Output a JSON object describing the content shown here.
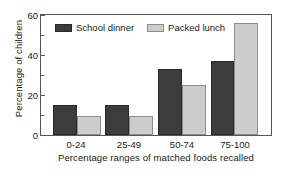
{
  "chart_data": {
    "type": "bar",
    "title": "",
    "subtitle": "",
    "xlabel": "Percentage ranges of matched foods recalled",
    "ylabel": "Percentage of children",
    "categories": [
      "0-24",
      "25-49",
      "50-74",
      "75-100"
    ],
    "series": [
      {
        "name": "School dinner",
        "values": [
          15,
          15,
          33,
          37
        ],
        "color": "#3c3c3c"
      },
      {
        "name": "Packed lunch",
        "values": [
          9.5,
          9.5,
          25,
          56
        ],
        "color": "#cdcdcd"
      }
    ],
    "ylim": [
      0,
      60
    ],
    "ytick_labels": [
      "0",
      "20",
      "40",
      "60"
    ],
    "ytick_values": [
      0,
      20,
      40,
      60
    ],
    "yminor_tick_values": [
      10,
      30,
      50
    ],
    "grid": false,
    "legend_position": "upper-left-inside",
    "legend_entries": [
      "School dinner",
      "Packed lunch"
    ],
    "annotations": []
  },
  "axes": {
    "y_title": "Percentage of children",
    "x_title": "Percentage ranges of matched foods recalled",
    "y_labels": {
      "t0": "0",
      "t20": "20",
      "t40": "40",
      "t60": "60"
    },
    "x_labels": {
      "c0": "0-24",
      "c1": "25-49",
      "c2": "50-74",
      "c3": "75-100"
    }
  },
  "legend": {
    "series_1_label": "School dinner",
    "series_2_label": "Packed lunch"
  }
}
